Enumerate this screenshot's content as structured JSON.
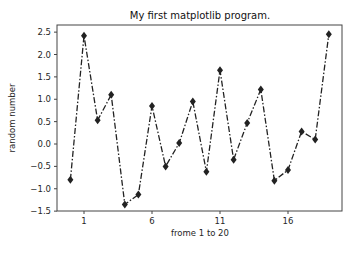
{
  "chart_data": {
    "type": "line",
    "title": "My first matplotlib program.",
    "xlabel": "frome 1 to 20",
    "ylabel": "random number",
    "x": [
      0,
      1,
      2,
      3,
      4,
      5,
      6,
      7,
      8,
      9,
      10,
      11,
      12,
      13,
      14,
      15,
      16,
      17,
      18,
      19
    ],
    "series": [
      {
        "name": "random",
        "values": [
          -0.8,
          2.42,
          0.53,
          1.1,
          -1.35,
          -1.13,
          0.85,
          -0.5,
          0.02,
          0.95,
          -0.62,
          1.65,
          -0.35,
          0.47,
          1.22,
          -0.82,
          -0.58,
          0.28,
          0.1,
          2.45
        ],
        "line_style": "dashdot",
        "marker": "diamond",
        "color": "#222222"
      }
    ],
    "xticks": [
      1,
      6,
      11,
      16
    ],
    "xtick_labels": [
      "1",
      "6",
      "11",
      "16"
    ],
    "yticks": [
      -1.5,
      -1.0,
      -0.5,
      0.0,
      0.5,
      1.0,
      1.5,
      2.0,
      2.5
    ],
    "ytick_labels": [
      "-1.5",
      "-1.0",
      "-0.5",
      "0.0",
      "0.5",
      "1.0",
      "1.5",
      "2.0",
      "2.5"
    ],
    "xlim": [
      -0.95,
      20.0
    ],
    "ylim": [
      -1.5,
      2.65
    ],
    "grid": false,
    "legend": null
  }
}
